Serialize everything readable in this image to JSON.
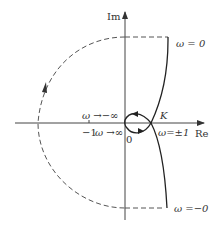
{
  "diagram": {
    "type": "nyquist-plot",
    "axes": {
      "imag_label": "Im",
      "real_label": "Re",
      "tick_minus_one": "−1"
    },
    "labels": {
      "omega_zero_top": "ω = 0",
      "omega_zero_bottom": "ω =−0",
      "omega_neg_inf": "ω →−∞",
      "omega_pos_inf": "ω →∞",
      "origin": "0",
      "point_k": "K",
      "omega_pm1": "ω=±1"
    },
    "colors": {
      "line": "#333333",
      "dashed": "#555555",
      "background": "#ffffff"
    }
  }
}
